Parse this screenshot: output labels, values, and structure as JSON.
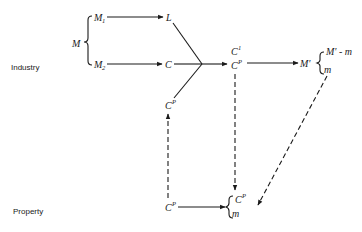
{
  "diagram": {
    "type": "flow-diagram",
    "rows": {
      "industry_label": "Industry",
      "property_label": "Property"
    },
    "nodes": {
      "M": "M",
      "M1": {
        "base": "M",
        "sub": "1"
      },
      "M2": {
        "base": "M",
        "sub": "2"
      },
      "L": "L",
      "C": "C",
      "CP_industry_left": {
        "base": "C",
        "sup": "P"
      },
      "C1": {
        "base": "C",
        "sup": "1"
      },
      "CP_industry_right": {
        "base": "C",
        "sup": "P"
      },
      "M_prime": "M'",
      "M_prime_minus_m": "M' - m",
      "m_industry": "m",
      "CP_property_left": {
        "base": "C",
        "sup": "P"
      },
      "CP_property_right": {
        "base": "C",
        "sup": "P"
      },
      "m_property": "m"
    },
    "edges": [
      {
        "from": "M1",
        "to": "L",
        "style": "solid"
      },
      {
        "from": "M2",
        "to": "C",
        "style": "solid"
      },
      {
        "from": "L",
        "to": "junction",
        "style": "solid"
      },
      {
        "from": "C",
        "to": "junction",
        "style": "solid"
      },
      {
        "from": "CP_industry_left",
        "to": "junction",
        "style": "solid"
      },
      {
        "from": "junction",
        "to": "C1/CP",
        "style": "solid"
      },
      {
        "from": "C1/CP",
        "to": "M_prime",
        "style": "solid"
      },
      {
        "from": "CP_property_left",
        "to": "CP_industry_left",
        "style": "dashed"
      },
      {
        "from": "CP_industry_right",
        "to": "CP_property_right",
        "style": "dashed"
      },
      {
        "from": "m_industry",
        "to": "m_property",
        "style": "dashed"
      },
      {
        "from": "CP_property_left",
        "to": "property_brace",
        "style": "solid"
      }
    ]
  }
}
